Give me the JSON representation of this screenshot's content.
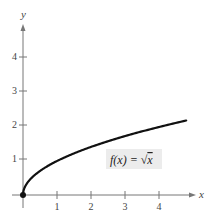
{
  "chart_data": {
    "type": "line",
    "title": "",
    "xlabel": "x",
    "ylabel": "y",
    "xlim": [
      0,
      4.8
    ],
    "ylim": [
      0,
      5
    ],
    "x_ticks": [
      "1",
      "2",
      "3",
      "4"
    ],
    "y_ticks": [
      "1",
      "2",
      "3",
      "4"
    ],
    "grid": false,
    "series": [
      {
        "name": "f(x) = √x",
        "x": [
          0,
          0.25,
          0.5,
          1,
          1.5,
          2,
          2.5,
          3,
          3.5,
          4,
          4.5,
          4.8
        ],
        "values": [
          0,
          0.5,
          0.71,
          1,
          1.22,
          1.41,
          1.58,
          1.73,
          1.87,
          2,
          2.12,
          2.19
        ]
      }
    ],
    "annotations": [
      {
        "text": "f(x) = √x",
        "x": 3.1,
        "y": 1.1
      },
      {
        "text": "point",
        "x": 0,
        "y": 0,
        "marker": "filled-circle"
      }
    ]
  },
  "labels": {
    "x_axis": "x",
    "y_axis": "y",
    "function_prefix": "f(x) = ",
    "function_radical": "√",
    "function_arg": "x",
    "xt1": "1",
    "xt2": "2",
    "xt3": "3",
    "xt4": "4",
    "yt1": "1",
    "yt2": "2",
    "yt3": "3",
    "yt4": "4"
  },
  "colors": {
    "axis": "#777777",
    "curve": "#111111",
    "label_box": "#ececec"
  }
}
